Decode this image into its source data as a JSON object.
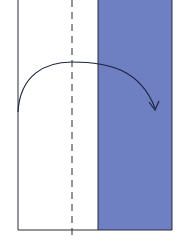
{
  "diagram": {
    "type": "origami-fold-step",
    "instruction_visual": "fold left panel over dashed valley line to the right",
    "colors": {
      "paper_front": "#ffffff",
      "paper_back": "#6e7fc2",
      "outline": "#2a2a3a",
      "arrow": "#1e2440"
    },
    "elements": {
      "paper": {
        "x": 18,
        "y": 0,
        "width": 154,
        "height": 230
      },
      "white_panel": {
        "x": 18,
        "width": 80
      },
      "blue_panel": {
        "x": 98,
        "width": 74
      },
      "fold_line": {
        "x": 72,
        "style": "dashed"
      },
      "arrow": {
        "direction": "left-to-right",
        "start": [
          18,
          112
        ],
        "end": [
          155,
          110
        ]
      }
    }
  }
}
